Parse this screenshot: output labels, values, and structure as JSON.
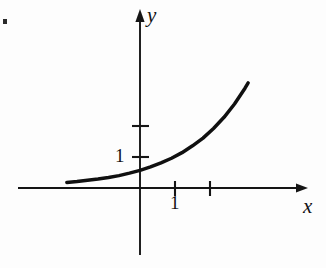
{
  "figure": {
    "background_color": "#fdfdfd",
    "ink_color": "#131313",
    "width": 326,
    "height": 268
  },
  "axes": {
    "x_axis": {
      "label": "x",
      "label_name": "x-axis-label",
      "arrow": "right",
      "origin_px": 140,
      "baseline_px": 188,
      "start_px": 18,
      "end_px": 308
    },
    "y_axis": {
      "label": "y",
      "label_name": "y-axis-label",
      "arrow": "up",
      "origin_px": 188,
      "axis_px": 140,
      "top_px": 10,
      "bottom_px": 255
    }
  },
  "ticks": {
    "x": [
      {
        "value": 1,
        "label": "1",
        "px": 175
      },
      {
        "value": 2,
        "label": "",
        "px": 210
      }
    ],
    "y": [
      {
        "value": 1,
        "label": "1",
        "px": 157
      },
      {
        "value": 2,
        "label": "",
        "px": 126
      }
    ]
  },
  "chart_data": {
    "type": "line",
    "xlabel": "x",
    "ylabel": "y",
    "xlim": [
      -2.1,
      4.8
    ],
    "ylim": [
      -2.1,
      5.7
    ],
    "grid": false,
    "legend": null,
    "x_ticks": [
      1,
      2
    ],
    "x_tick_labels": [
      "1",
      ""
    ],
    "y_ticks": [
      1,
      2
    ],
    "y_tick_labels": [
      "1",
      ""
    ],
    "series": [
      {
        "name": "exponential curve",
        "color": "#101010",
        "x": [
          -2.09,
          -1.8,
          -1.5,
          -1.2,
          -0.9,
          -0.6,
          -0.3,
          0.0,
          0.3,
          0.6,
          0.9,
          1.2,
          1.5,
          1.8,
          2.1,
          2.4,
          2.7,
          3.0,
          3.09
        ],
        "y": [
          0.18,
          0.21,
          0.25,
          0.29,
          0.34,
          0.4,
          0.48,
          0.57,
          0.68,
          0.81,
          0.96,
          1.14,
          1.36,
          1.61,
          1.92,
          2.28,
          2.71,
          3.22,
          3.39
        ]
      }
    ],
    "annotations": []
  },
  "artifacts": {
    "scan_speck": {
      "name": "scan-speck",
      "x": 3,
      "y": 19,
      "width": 4,
      "height": 5
    }
  }
}
